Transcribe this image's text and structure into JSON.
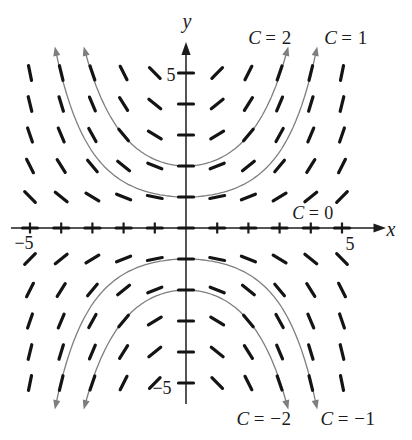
{
  "chart_data": {
    "type": "slope_field",
    "equation": "dy/dx = 0.2xy",
    "slope_coefficient": 0.2,
    "x_range": [
      -5,
      5
    ],
    "y_range": [
      -5,
      5
    ],
    "grid_step": 1,
    "curve_draw_limit_y": 5.7,
    "axes": {
      "x_label": "x",
      "y_label": "y"
    },
    "ticks": {
      "x_min_label": "−5",
      "x_max_label": "5",
      "y_max_label": "5",
      "y_min_label": "−5"
    },
    "solution_curves": [
      {
        "C": 2,
        "label_var": "C",
        "label_rest": "= 2"
      },
      {
        "C": 1,
        "label_var": "C",
        "label_rest": "= 1"
      },
      {
        "C": 0,
        "label_var": "C",
        "label_rest": "= 0"
      },
      {
        "C": -2,
        "label_var": "C",
        "label_rest": "= −2"
      },
      {
        "C": -1,
        "label_var": "C",
        "label_rest": "= −1"
      }
    ],
    "colors": {
      "slope_marks": "#141414",
      "curves": "#7e7e7e",
      "axes": "#1c1c1c",
      "text": "#1b1b1b"
    }
  }
}
